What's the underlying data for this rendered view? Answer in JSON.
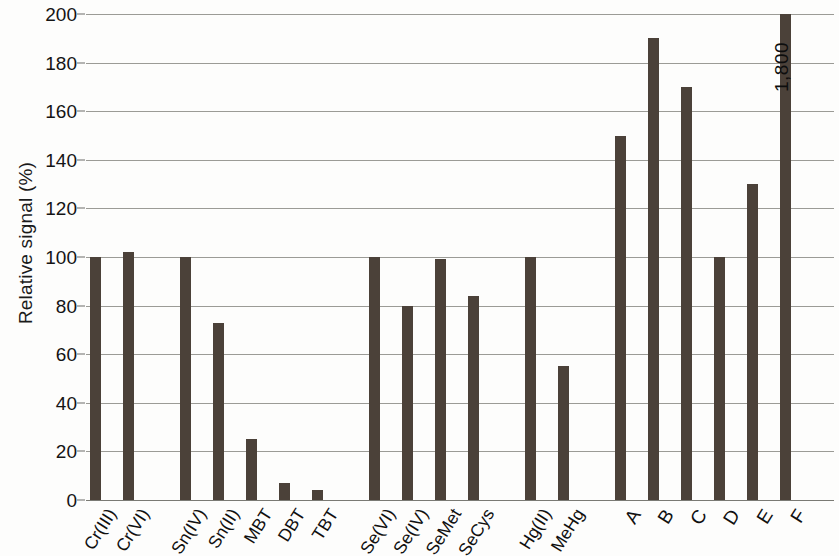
{
  "chart_data": {
    "type": "bar",
    "title": "",
    "subtitle": "",
    "xlabel": "",
    "ylabel": "Relative signal (%)",
    "ylim": [
      0,
      200
    ],
    "ytick_step": 20,
    "yticks": [
      0,
      20,
      40,
      60,
      80,
      100,
      120,
      140,
      160,
      180,
      200
    ],
    "grid": true,
    "legend": "none",
    "bar_color": "#4b4139",
    "categories": [
      "Cr(III)",
      "Cr(VI)",
      "Sn(IV)",
      "Sn(II)",
      "MBT",
      "DBT",
      "TBT",
      "Se(VI)",
      "Se(IV)",
      "SeMet",
      "SeCys",
      "Hg(II)",
      "MeHg",
      "A",
      "B",
      "C",
      "D",
      "E",
      "F"
    ],
    "values": [
      100,
      102,
      100,
      73,
      25,
      7,
      4,
      100,
      80,
      99,
      84,
      100,
      55,
      150,
      190,
      170,
      100,
      130,
      1800
    ],
    "groups": [
      {
        "name": "chromium",
        "categories": [
          "Cr(III)",
          "Cr(VI)"
        ]
      },
      {
        "name": "tin",
        "categories": [
          "Sn(IV)",
          "Sn(II)",
          "MBT",
          "DBT",
          "TBT"
        ]
      },
      {
        "name": "selenium",
        "categories": [
          "Se(VI)",
          "Se(IV)",
          "SeMet",
          "SeCys"
        ]
      },
      {
        "name": "mercury",
        "categories": [
          "Hg(II)",
          "MeHg"
        ]
      },
      {
        "name": "samples",
        "categories": [
          "A",
          "B",
          "C",
          "D",
          "E",
          "F"
        ]
      }
    ],
    "annotations": [
      {
        "label": "1,800",
        "attached_to": "F",
        "note": "value exceeds axis maximum"
      }
    ]
  }
}
